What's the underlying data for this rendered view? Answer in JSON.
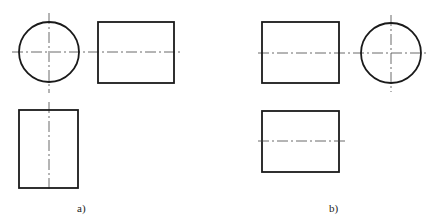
{
  "figure": {
    "type": "orthographic projection comparison",
    "colors": {
      "outline": "#1a1a1a",
      "centerline": "#444444",
      "background": "#ffffff"
    },
    "panels": [
      {
        "id": "a",
        "label": "a)",
        "views": [
          {
            "name": "circular view",
            "shape": "circle",
            "centerlines": [
              "horizontal",
              "vertical"
            ]
          },
          {
            "name": "side view",
            "shape": "rectangle",
            "centerlines": [
              "horizontal"
            ]
          },
          {
            "name": "bottom view",
            "shape": "rectangle",
            "centerlines": [
              "vertical"
            ]
          }
        ]
      },
      {
        "id": "b",
        "label": "b)",
        "views": [
          {
            "name": "side view",
            "shape": "rectangle",
            "centerlines": [
              "horizontal"
            ]
          },
          {
            "name": "circular view",
            "shape": "circle",
            "centerlines": [
              "horizontal",
              "vertical"
            ]
          },
          {
            "name": "bottom view",
            "shape": "rectangle",
            "centerlines": [
              "horizontal"
            ]
          }
        ]
      }
    ]
  }
}
